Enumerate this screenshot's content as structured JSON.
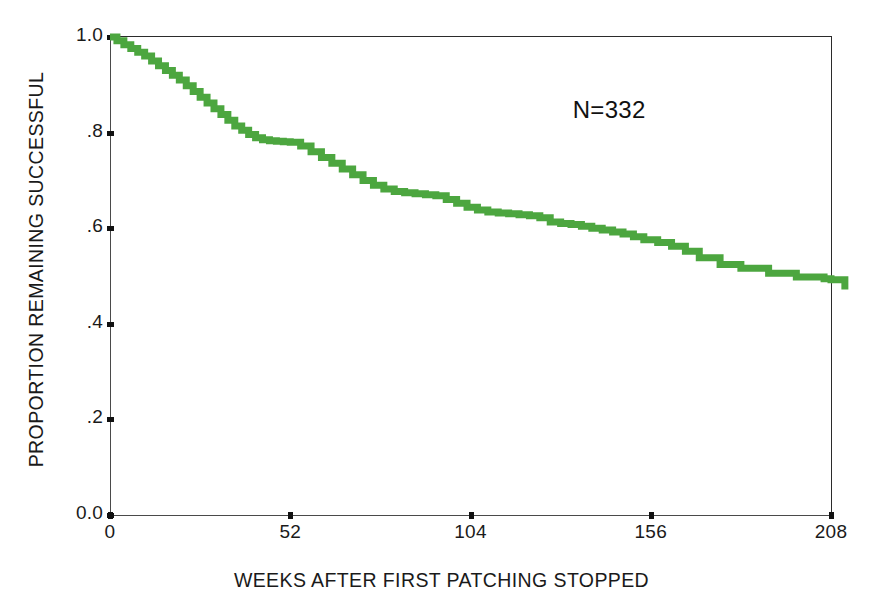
{
  "chart_data": {
    "type": "line",
    "subtype": "kaplan-meier-survival-step",
    "title": "",
    "subtitle": "",
    "xlabel": "WEEKS AFTER FIRST PATCHING STOPPED",
    "ylabel": "PROPORTION REMAINING SUCCESSFUL",
    "xlim": [
      0,
      208
    ],
    "ylim": [
      0.0,
      1.0
    ],
    "xticks": [
      0,
      52,
      104,
      156,
      208
    ],
    "xtick_labels": [
      "0",
      "52",
      "104",
      "156",
      "208"
    ],
    "yticks": [
      0.0,
      0.2,
      0.4,
      0.6,
      0.8,
      1.0
    ],
    "ytick_labels": [
      "0.0",
      ".2",
      ".4",
      ".6",
      ".8",
      "1.0"
    ],
    "grid": false,
    "legend": null,
    "legend_position": "none",
    "annotations": [
      {
        "text": "N=332",
        "x": 144,
        "y": 0.845
      }
    ],
    "series": [
      {
        "name": "Proportion remaining successful",
        "color": "#4ca63f",
        "line_width": 7,
        "step": "post",
        "n_at_risk_start": 332,
        "x": [
          0,
          2,
          4,
          6,
          8,
          10,
          12,
          14,
          16,
          18,
          20,
          22,
          24,
          26,
          28,
          30,
          32,
          34,
          36,
          38,
          40,
          42,
          44,
          46,
          48,
          50,
          52,
          55,
          58,
          61,
          64,
          67,
          70,
          73,
          76,
          79,
          82,
          85,
          88,
          91,
          94,
          97,
          100,
          103,
          106,
          109,
          112,
          115,
          118,
          121,
          124,
          127,
          130,
          133,
          136,
          139,
          142,
          145,
          148,
          151,
          154,
          158,
          162,
          166,
          170,
          176,
          182,
          190,
          198,
          206,
          208,
          212
        ],
        "y": [
          1.0,
          0.992,
          0.984,
          0.976,
          0.968,
          0.96,
          0.95,
          0.94,
          0.93,
          0.92,
          0.91,
          0.898,
          0.886,
          0.874,
          0.862,
          0.85,
          0.838,
          0.826,
          0.814,
          0.805,
          0.796,
          0.789,
          0.785,
          0.783,
          0.782,
          0.781,
          0.78,
          0.772,
          0.76,
          0.748,
          0.736,
          0.724,
          0.712,
          0.7,
          0.69,
          0.682,
          0.677,
          0.674,
          0.672,
          0.67,
          0.668,
          0.66,
          0.652,
          0.644,
          0.638,
          0.634,
          0.632,
          0.63,
          0.628,
          0.626,
          0.622,
          0.613,
          0.61,
          0.608,
          0.604,
          0.6,
          0.596,
          0.592,
          0.588,
          0.582,
          0.576,
          0.57,
          0.562,
          0.552,
          0.538,
          0.524,
          0.516,
          0.506,
          0.498,
          0.494,
          0.492,
          0.472
        ]
      }
    ]
  },
  "axes": {
    "y_ticks": [
      {
        "label": "1.0",
        "value": 1.0
      },
      {
        "label": ".8",
        "value": 0.8
      },
      {
        "label": ".6",
        "value": 0.6
      },
      {
        "label": ".4",
        "value": 0.4
      },
      {
        "label": ".2",
        "value": 0.2
      },
      {
        "label": "0.0",
        "value": 0.0
      }
    ],
    "x_ticks": [
      {
        "label": "0",
        "value": 0
      },
      {
        "label": "52",
        "value": 52
      },
      {
        "label": "104",
        "value": 104
      },
      {
        "label": "156",
        "value": 156
      },
      {
        "label": "208",
        "value": 208
      }
    ],
    "x_axis_title": "WEEKS AFTER FIRST PATCHING STOPPED",
    "y_axis_title": "PROPORTION REMAINING SUCCESSFUL"
  },
  "annotation": {
    "sample_size_label": "N=332"
  },
  "colors": {
    "curve": "#4ca63f",
    "axis": "#2b2b2b",
    "text": "#1a1a1a",
    "background": "#ffffff"
  }
}
